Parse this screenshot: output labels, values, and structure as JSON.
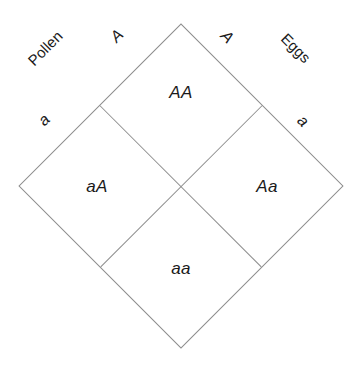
{
  "figure": {
    "type": "punnett-square",
    "orientation": "diamond",
    "line_color": "#8c8c8c",
    "background_color": "#ffffff",
    "text_color": "#1a1a1a"
  },
  "axes": {
    "pollen": {
      "title": "Pollen",
      "alleles": [
        {
          "label": "A"
        },
        {
          "label": "a"
        }
      ]
    },
    "eggs": {
      "title": "Eggs",
      "alleles": [
        {
          "label": "A"
        },
        {
          "label": "a"
        }
      ]
    }
  },
  "cells": {
    "top": "AA",
    "left": "aA",
    "right": "Aa",
    "bottom": "aa"
  }
}
